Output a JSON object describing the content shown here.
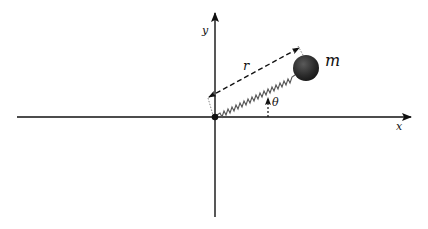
{
  "diagram": {
    "labels": {
      "x_axis": "x",
      "y_axis": "y",
      "radius": "r",
      "angle": "θ",
      "mass": "m"
    },
    "colors": {
      "axis": "#111111",
      "mass": "#2a2a2a",
      "spring": "#555555",
      "dashed": "#111111"
    },
    "elements": [
      {
        "type": "axis",
        "name": "x-axis",
        "from": [
          17,
          117
        ],
        "to": [
          412,
          117
        ]
      },
      {
        "type": "axis",
        "name": "y-axis",
        "from": [
          215,
          217
        ],
        "to": [
          215,
          12
        ]
      },
      {
        "type": "point",
        "name": "origin",
        "at": [
          215,
          117
        ]
      },
      {
        "type": "spring",
        "name": "spring",
        "from": [
          217,
          115
        ],
        "to": [
          295,
          74
        ]
      },
      {
        "type": "mass",
        "name": "mass-ball",
        "center": [
          306,
          68
        ],
        "radius": 13
      },
      {
        "type": "dashed-arrow",
        "name": "r-vector",
        "from": [
          208,
          98
        ],
        "to": [
          300,
          48
        ]
      },
      {
        "type": "dotted-arrow",
        "name": "theta-marker",
        "from": [
          268,
          117
        ],
        "to": [
          268,
          97
        ]
      }
    ]
  }
}
